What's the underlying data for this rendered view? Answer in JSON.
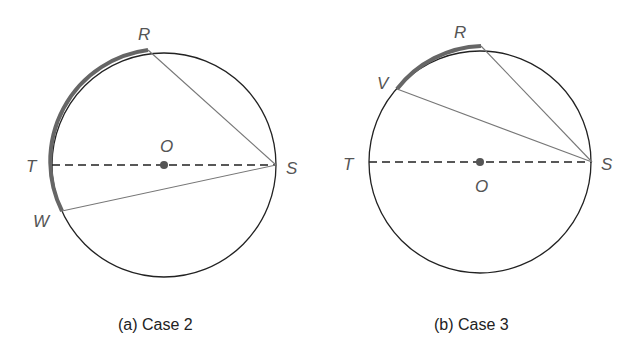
{
  "figures": [
    {
      "id": "a",
      "caption": "(a) Case 2",
      "labels": {
        "R": "R",
        "O": "O",
        "T": "T",
        "S": "S",
        "W": "W"
      }
    },
    {
      "id": "b",
      "caption": "(b) Case 3",
      "labels": {
        "R": "R",
        "V": "V",
        "T": "T",
        "S": "S",
        "O": "O"
      }
    }
  ],
  "colors": {
    "circle": "#222222",
    "highlight_arc": "#666666",
    "chord": "#777777",
    "center_dot": "#555555"
  }
}
